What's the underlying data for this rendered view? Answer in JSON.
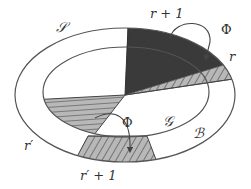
{
  "figure": {
    "regions": {
      "outer_label": "𝒮",
      "band_label": "ℬ",
      "inner_label": "𝒢"
    },
    "sectors": {
      "top_dark": "r + 1",
      "top_right_hatched": "r",
      "left_hatched": "r′",
      "bottom_trapezoid": "r′ + 1"
    },
    "arrows": {
      "top_map": "Φ",
      "bottom_map": "Φ"
    },
    "colors": {
      "line": "#555555",
      "dark_fill": "#3a3a3a",
      "hatch_fill": "#b8b8b8",
      "hatch_line": "#444444",
      "background": "#ffffff"
    }
  }
}
